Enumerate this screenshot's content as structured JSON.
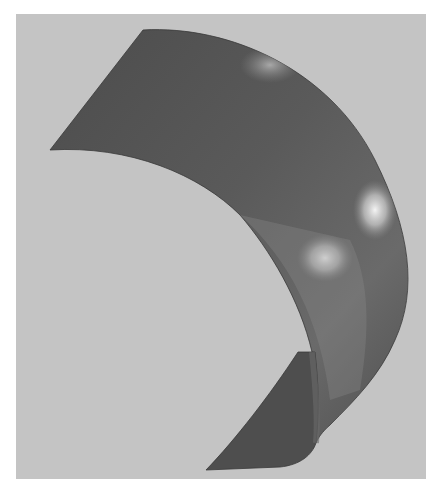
{
  "figure": {
    "background_color": "#c4c4c4",
    "surface_dark_color": "#4a4a4a",
    "surface_mid_color": "#6e6e6e",
    "highlight_color": "#f2f2f2",
    "border_color": "#ffffff"
  }
}
